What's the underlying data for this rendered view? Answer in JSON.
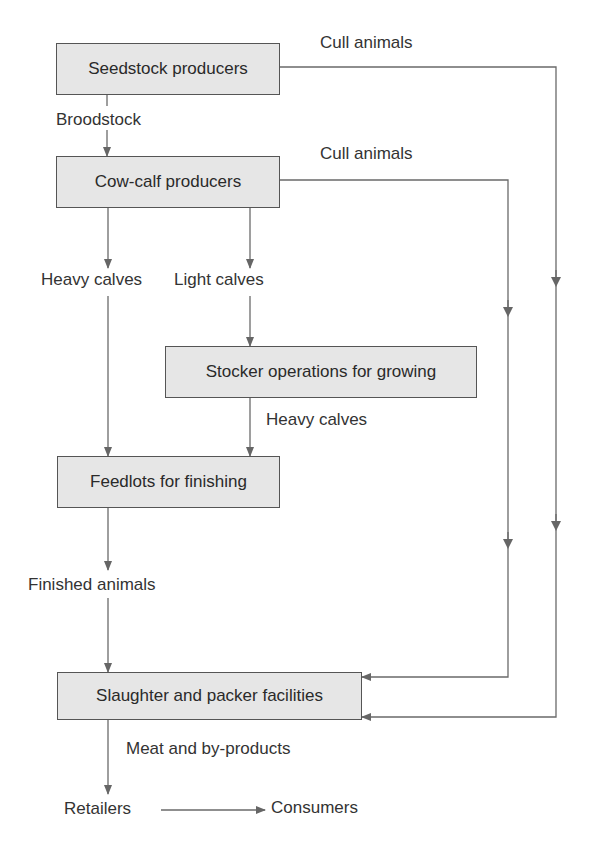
{
  "diagram": {
    "type": "flowchart",
    "nodes": {
      "seedstock": "Seedstock producers",
      "cowcalf": "Cow-calf producers",
      "stocker": "Stocker operations for growing",
      "feedlots": "Feedlots for finishing",
      "slaughter": "Slaughter and packer facilities",
      "retailers": "Retailers",
      "consumers": "Consumers"
    },
    "edge_labels": {
      "cull_1": "Cull animals",
      "cull_2": "Cull animals",
      "broodstock": "Broodstock",
      "heavy_calves_1": "Heavy calves",
      "light_calves": "Light calves",
      "heavy_calves_2": "Heavy calves",
      "finished": "Finished animals",
      "meat": "Meat and by-products"
    },
    "edges": [
      {
        "from": "Seedstock producers",
        "to": "Cow-calf producers",
        "label": "Broodstock"
      },
      {
        "from": "Seedstock producers",
        "to": "Slaughter and packer facilities",
        "label": "Cull animals"
      },
      {
        "from": "Cow-calf producers",
        "to": "Slaughter and packer facilities",
        "label": "Cull animals"
      },
      {
        "from": "Cow-calf producers",
        "to": "Feedlots for finishing",
        "label": "Heavy calves"
      },
      {
        "from": "Cow-calf producers",
        "to": "Stocker operations for growing",
        "label": "Light calves"
      },
      {
        "from": "Stocker operations for growing",
        "to": "Feedlots for finishing",
        "label": "Heavy calves"
      },
      {
        "from": "Feedlots for finishing",
        "to": "Slaughter and packer facilities",
        "label": "Finished animals"
      },
      {
        "from": "Slaughter and packer facilities",
        "to": "Retailers",
        "label": "Meat and by-products"
      },
      {
        "from": "Retailers",
        "to": "Consumers",
        "label": ""
      }
    ],
    "colors": {
      "box_fill": "#e6e6e6",
      "line": "#666666",
      "text": "#2e2e2e"
    }
  }
}
